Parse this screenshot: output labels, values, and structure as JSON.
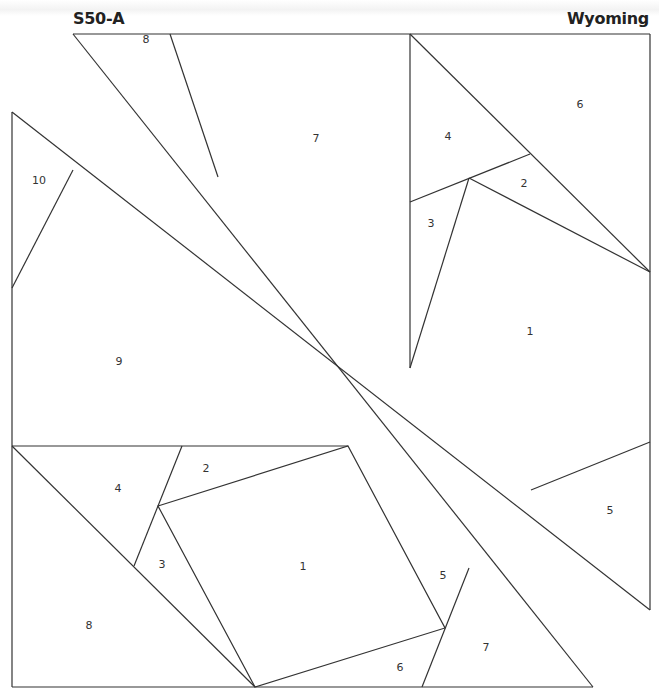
{
  "header": {
    "block_id": "S50-A",
    "block_name": "Wyoming"
  },
  "colors": {
    "line": "#333333",
    "background": "#ffffff",
    "title": "#222222"
  },
  "sections": {
    "upper_left": {
      "labels": [
        {
          "text": "8",
          "x": 146,
          "y": 43
        },
        {
          "text": "7",
          "x": 316,
          "y": 142
        },
        {
          "text": "10",
          "x": 39,
          "y": 184
        },
        {
          "text": "9",
          "x": 119,
          "y": 365
        }
      ]
    },
    "upper_right": {
      "labels": [
        {
          "text": "6",
          "x": 580,
          "y": 108
        },
        {
          "text": "4",
          "x": 448,
          "y": 140
        },
        {
          "text": "2",
          "x": 524,
          "y": 187
        },
        {
          "text": "3",
          "x": 431,
          "y": 227
        },
        {
          "text": "1",
          "x": 530,
          "y": 335
        },
        {
          "text": "5",
          "x": 610,
          "y": 514
        }
      ]
    },
    "lower_left": {
      "labels": [
        {
          "text": "2",
          "x": 206,
          "y": 472
        },
        {
          "text": "4",
          "x": 118,
          "y": 492
        },
        {
          "text": "3",
          "x": 162,
          "y": 568
        },
        {
          "text": "1",
          "x": 303,
          "y": 570
        },
        {
          "text": "5",
          "x": 443,
          "y": 579
        },
        {
          "text": "8",
          "x": 89,
          "y": 629
        },
        {
          "text": "7",
          "x": 486,
          "y": 651
        },
        {
          "text": "6",
          "x": 400,
          "y": 671
        }
      ]
    }
  }
}
